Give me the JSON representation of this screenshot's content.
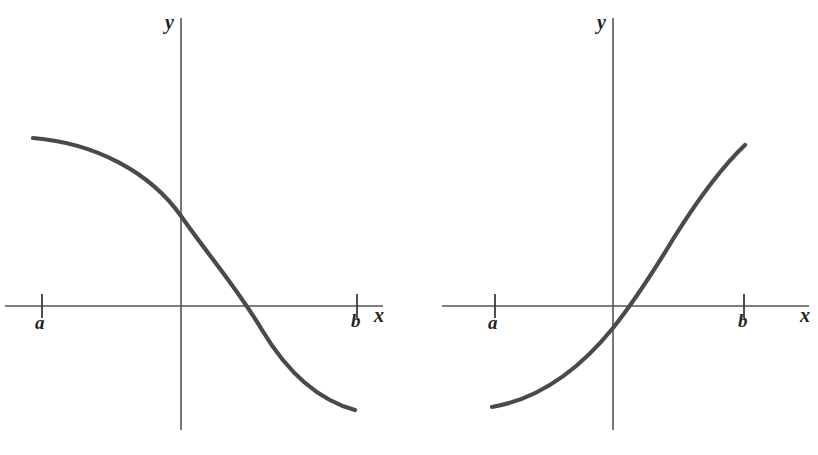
{
  "figure": {
    "background_color": "#ffffff",
    "axis_color": "#555555",
    "curve_color": "#4a4a4a",
    "label_color": "#232323",
    "width": 818,
    "height": 455
  },
  "panels": [
    {
      "id": "left",
      "caption": "",
      "axes": {
        "x_label": "x",
        "y_label": "y",
        "x_axis_y": 306,
        "x_axis_from": 5,
        "x_axis_to": 383,
        "y_axis_x": 181,
        "y_axis_from": 18,
        "y_axis_to": 430
      },
      "ticks": [
        {
          "label": "a",
          "x": 42
        },
        {
          "label": "b",
          "x": 357
        }
      ],
      "curve": {
        "shape": "decreasing-s-curve",
        "path": "M 33 138 C 95 143, 150 172, 181 216 C 212 260, 237 288, 262 330 C 292 380, 325 402, 355 410"
      }
    },
    {
      "id": "right",
      "caption": "",
      "axes": {
        "x_label": "x",
        "y_label": "y",
        "x_axis_y": 306,
        "x_axis_from": 33,
        "x_axis_to": 400,
        "y_axis_x": 204,
        "y_axis_from": 18,
        "y_axis_to": 430
      },
      "ticks": [
        {
          "label": "a",
          "x": 86
        },
        {
          "label": "b",
          "x": 335
        }
      ],
      "curve": {
        "shape": "increasing-convex-curve",
        "path": "M 83 407 C 124 400, 165 376, 204 328 C 224 303, 243 274, 266 236 C 295 190, 317 163, 336 145"
      }
    }
  ],
  "chart_data": {
    "type": "line",
    "title": "",
    "xlabel": "x",
    "ylabel": "y",
    "grid": false,
    "legend": "none",
    "panels": [
      {
        "name": "left-plot",
        "description": "Monotonically decreasing S-shaped (sigmoid-like) curve defined on [a, b], positive at x = a, negative at x = b, crossing the x-axis between 0 and b.",
        "xlim": [
          "a",
          "b"
        ],
        "x_tick_labels": [
          "a",
          "b"
        ],
        "y_tick_labels": [],
        "monotonic": "decreasing",
        "x_intercept_fraction": 0.65,
        "y_intercept_sign": "positive",
        "points": [
          {
            "x": 0.0,
            "y": 0.84
          },
          {
            "x": 0.1,
            "y": 0.82
          },
          {
            "x": 0.2,
            "y": 0.76
          },
          {
            "x": 0.3,
            "y": 0.66
          },
          {
            "x": 0.4,
            "y": 0.5
          },
          {
            "x": 0.46,
            "y": 0.33
          },
          {
            "x": 0.55,
            "y": 0.13
          },
          {
            "x": 0.65,
            "y": 0.0
          },
          {
            "x": 0.75,
            "y": -0.18
          },
          {
            "x": 0.85,
            "y": -0.34
          },
          {
            "x": 1.0,
            "y": -0.47
          }
        ]
      },
      {
        "name": "right-plot",
        "description": "Monotonically increasing convex curve defined on [a, b], negative at x = a, positive at x = b, crossing the x-axis just to the right of the y-axis.",
        "xlim": [
          "a",
          "b"
        ],
        "x_tick_labels": [
          "a",
          "b"
        ],
        "y_tick_labels": [],
        "monotonic": "increasing",
        "x_intercept_fraction": 0.57,
        "y_intercept_sign": "negative",
        "points": [
          {
            "x": 0.0,
            "y": -0.4
          },
          {
            "x": 0.12,
            "y": -0.37
          },
          {
            "x": 0.25,
            "y": -0.28
          },
          {
            "x": 0.4,
            "y": -0.12
          },
          {
            "x": 0.48,
            "y": -0.05
          },
          {
            "x": 0.57,
            "y": 0.0
          },
          {
            "x": 0.65,
            "y": 0.12
          },
          {
            "x": 0.75,
            "y": 0.27
          },
          {
            "x": 0.85,
            "y": 0.42
          },
          {
            "x": 1.0,
            "y": 0.62
          }
        ]
      }
    ]
  }
}
